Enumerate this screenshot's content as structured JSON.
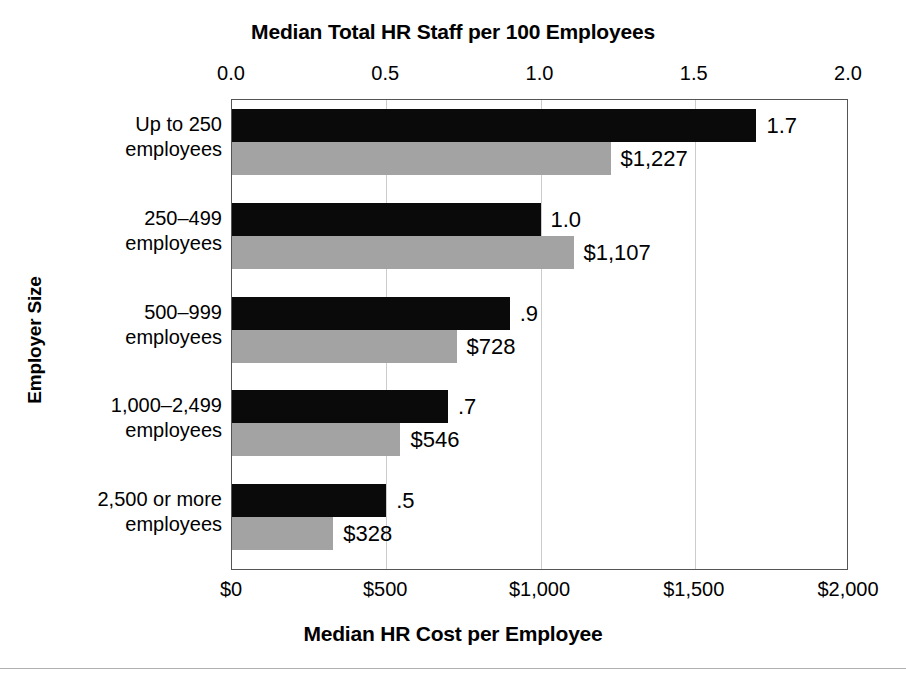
{
  "chart_data": {
    "type": "bar",
    "orientation": "horizontal",
    "title": "Median Total HR Staff per 100 Employees",
    "xlabel": "Median HR Cost per Employee",
    "ylabel": "Employer Size",
    "grid": true,
    "legend_position": "none",
    "categories": [
      "Up to 250 employees",
      "250–499 employees",
      "500–999 employees",
      "1,000–2,499 employees",
      "2,500 or more employees"
    ],
    "category_lines": [
      [
        "Up to 250",
        "employees"
      ],
      [
        "250–499",
        "employees"
      ],
      [
        "500–999",
        "employees"
      ],
      [
        "1,000–2,499",
        "employees"
      ],
      [
        "2,500 or more",
        "employees"
      ]
    ],
    "series": [
      {
        "name": "Median Total HR Staff per 100 Employees",
        "axis": "top",
        "color": "#0a0a0a",
        "values": [
          1.7,
          1.0,
          0.9,
          0.7,
          0.5
        ],
        "labels": [
          "1.7",
          "1.0",
          ".9",
          ".7",
          ".5"
        ]
      },
      {
        "name": "Median HR Cost per Employee",
        "axis": "bottom",
        "color": "#a3a3a3",
        "values": [
          1227,
          1107,
          728,
          546,
          328
        ],
        "labels": [
          "$1,227",
          "$1,107",
          "$728",
          "$546",
          "$328"
        ]
      }
    ],
    "top_axis": {
      "title": "Median Total HR Staff per 100 Employees",
      "min": 0.0,
      "max": 2.0,
      "ticks": [
        0.0,
        0.5,
        1.0,
        1.5,
        2.0
      ],
      "tick_labels": [
        "0.0",
        "0.5",
        "1.0",
        "1.5",
        "2.0"
      ]
    },
    "bottom_axis": {
      "title": "Median HR Cost per Employee",
      "min": 0,
      "max": 2000,
      "ticks": [
        0,
        500,
        1000,
        1500,
        2000
      ],
      "tick_labels": [
        "$0",
        "$500",
        "$1,000",
        "$1,500",
        "$2,000"
      ]
    }
  },
  "colors": {
    "staff_bar": "#0a0a0a",
    "cost_bar": "#a3a3a3",
    "gridline": "#cccccc",
    "frame": "#555555",
    "background": "#ffffff"
  }
}
